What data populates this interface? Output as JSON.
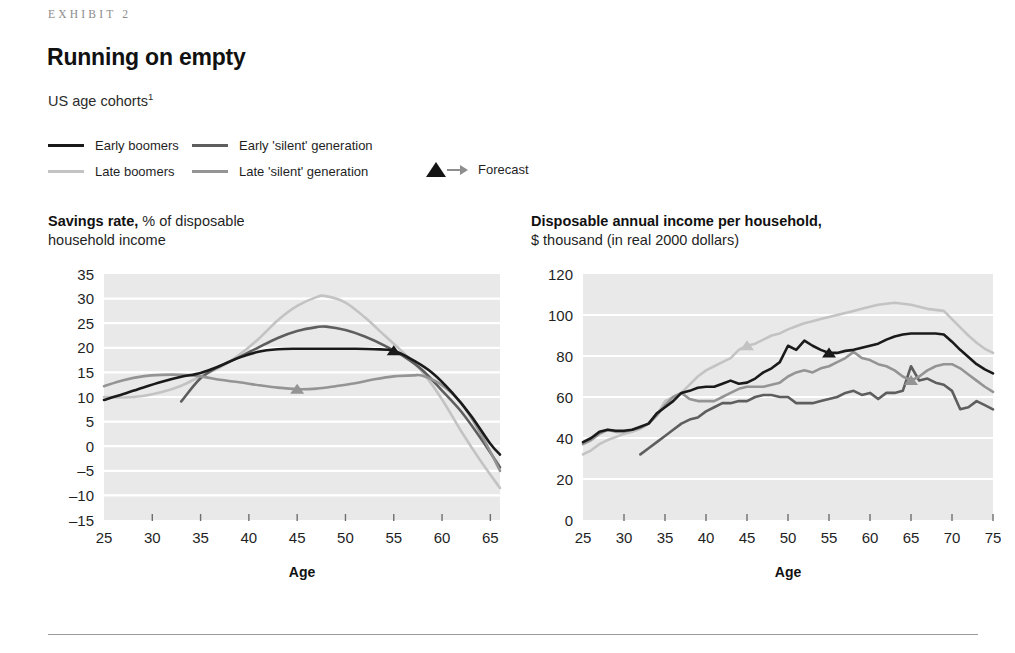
{
  "header": {
    "exhibit_label": "EXHIBIT 2",
    "headline": "Running on empty",
    "subhead": "US age cohorts",
    "subhead_footnote": "1"
  },
  "legend": {
    "items": [
      {
        "label": "Early boomers",
        "color": "#1a1a1a",
        "key": "early_boomers"
      },
      {
        "label": "Late boomers",
        "color": "#c3c3c3",
        "key": "late_boomers"
      },
      {
        "label": "Early 'silent' generation",
        "color": "#5e5e5e",
        "key": "early_silent"
      },
      {
        "label": "Late 'silent' generation",
        "color": "#949494",
        "key": "late_silent"
      }
    ],
    "forecast_label": "Forecast",
    "forecast_marker_color": "#141414",
    "forecast_arrow_color": "#8e8e8e"
  },
  "colors": {
    "plot_background": "#e9e9e9",
    "gridline": "#ffffff",
    "axis_text": "#1f1f1f",
    "tick": "#6e6e6e"
  },
  "chart_data": [
    {
      "id": "savings-rate",
      "type": "line",
      "title_bold": "Savings rate,",
      "title_rest": " % of disposable",
      "title_line2": "household income",
      "xlabel": "Age",
      "ylabel": "",
      "xlim": [
        25,
        66
      ],
      "ylim": [
        -15,
        35
      ],
      "xticks": [
        25,
        30,
        35,
        40,
        45,
        50,
        55,
        60,
        65
      ],
      "yticks": [
        35,
        30,
        25,
        20,
        15,
        10,
        5,
        0,
        -5,
        -10,
        -15
      ],
      "ytick_labels": [
        "35",
        "30",
        "25",
        "20",
        "15",
        "10",
        "5",
        "0",
        "–5",
        "–10",
        "–15"
      ],
      "grid": "horizontal",
      "legend_position": "above-figure",
      "series": [
        {
          "name": "Early boomers",
          "color": "#1a1a1a",
          "forecast_marker": {
            "x": 55,
            "y": 19.4
          },
          "x": [
            25,
            27,
            29,
            31,
            33,
            35,
            37,
            39,
            41,
            43,
            45,
            47,
            49,
            51,
            53,
            55,
            57,
            59,
            61,
            63,
            65,
            66
          ],
          "y": [
            9.4,
            10.6,
            11.9,
            13.1,
            14.1,
            14.9,
            16.3,
            18.0,
            19.2,
            19.7,
            19.8,
            19.8,
            19.8,
            19.8,
            19.7,
            19.4,
            17.5,
            14.9,
            11.0,
            6.2,
            0.5,
            -1.7
          ]
        },
        {
          "name": "Late boomers",
          "color": "#c3c3c3",
          "forecast_marker": null,
          "x": [
            25,
            27,
            29,
            31,
            33,
            35,
            37,
            39,
            41,
            43,
            45,
            47,
            48,
            50,
            52,
            54,
            56,
            58,
            60,
            62,
            64,
            66
          ],
          "y": [
            10.0,
            9.9,
            10.2,
            11.0,
            12.3,
            14.2,
            16.0,
            18.6,
            21.8,
            25.6,
            28.5,
            30.3,
            30.5,
            29.2,
            26.2,
            22.6,
            19.0,
            15.0,
            9.5,
            3.0,
            -3.0,
            -8.5
          ]
        },
        {
          "name": "Early 'silent' generation",
          "color": "#5e5e5e",
          "forecast_marker": null,
          "x": [
            33,
            35,
            37,
            39,
            41,
            43,
            45,
            47,
            48,
            50,
            52,
            54,
            56,
            58,
            60,
            62,
            64,
            66
          ],
          "y": [
            9.1,
            13.8,
            16.3,
            18.1,
            20.1,
            22.0,
            23.4,
            24.2,
            24.3,
            23.6,
            22.3,
            20.5,
            18.3,
            15.4,
            11.3,
            7.0,
            1.6,
            -4.3
          ]
        },
        {
          "name": "Late 'silent' generation",
          "color": "#949494",
          "forecast_marker": {
            "x": 45,
            "y": 11.6
          },
          "x": [
            25,
            27,
            29,
            31,
            33,
            35,
            37,
            39,
            41,
            43,
            45,
            47,
            49,
            51,
            53,
            55,
            57,
            58,
            60,
            62,
            64,
            66
          ],
          "y": [
            12.2,
            13.4,
            14.2,
            14.5,
            14.5,
            14.2,
            13.5,
            13.0,
            12.4,
            11.9,
            11.6,
            11.7,
            12.2,
            12.8,
            13.6,
            14.2,
            14.4,
            14.3,
            12.4,
            8.7,
            2.6,
            -5.0
          ]
        }
      ]
    },
    {
      "id": "disposable-income",
      "type": "line",
      "title_bold": "Disposable annual income per household,",
      "title_rest": "",
      "title_line2": "$ thousand (in real 2000 dollars)",
      "xlabel": "Age",
      "ylabel": "",
      "xlim": [
        25,
        75
      ],
      "ylim": [
        0,
        120
      ],
      "xticks": [
        25,
        30,
        35,
        40,
        45,
        50,
        55,
        60,
        65,
        70,
        75
      ],
      "yticks": [
        120,
        100,
        80,
        60,
        40,
        20,
        0
      ],
      "ytick_labels": [
        "120",
        "100",
        "80",
        "60",
        "40",
        "20",
        "0"
      ],
      "grid": "horizontal",
      "legend_position": "above-figure",
      "series": [
        {
          "name": "Early boomers",
          "color": "#1a1a1a",
          "forecast_marker": {
            "x": 55,
            "y": 81.5
          },
          "x": [
            25,
            26,
            27,
            28,
            29,
            30,
            31,
            32,
            33,
            34,
            35,
            36,
            37,
            38,
            39,
            40,
            41,
            42,
            43,
            44,
            45,
            46,
            47,
            48,
            49,
            50,
            51,
            52,
            53,
            54,
            55,
            56,
            57,
            58,
            59,
            60,
            61,
            62,
            63,
            64,
            65,
            66,
            67,
            68,
            69,
            70,
            71,
            72,
            73,
            74,
            75
          ],
          "y": [
            38,
            40,
            43,
            44,
            43.5,
            43.5,
            44,
            45.5,
            47,
            52,
            55,
            58,
            62,
            63,
            64.5,
            65,
            65,
            66.5,
            68,
            66.5,
            67,
            69,
            72,
            74,
            77,
            85,
            83,
            87.5,
            85,
            83,
            81.5,
            81.5,
            82.5,
            83,
            84,
            85,
            86,
            88,
            89.5,
            90.5,
            91,
            91,
            91,
            91,
            90.5,
            87,
            83,
            79.5,
            76,
            73.5,
            71.5
          ]
        },
        {
          "name": "Late boomers",
          "color": "#c3c3c3",
          "forecast_marker": {
            "x": 45,
            "y": 85
          },
          "x": [
            25,
            26,
            27,
            28,
            29,
            30,
            31,
            32,
            33,
            34,
            35,
            36,
            37,
            38,
            39,
            40,
            41,
            42,
            43,
            44,
            45,
            46,
            47,
            48,
            49,
            50,
            51,
            52,
            53,
            54,
            55,
            56,
            57,
            58,
            59,
            60,
            61,
            62,
            63,
            64,
            65,
            66,
            67,
            68,
            69,
            70,
            71,
            72,
            73,
            74,
            75
          ],
          "y": [
            32,
            34,
            37,
            39,
            40.5,
            42,
            43,
            44.5,
            47,
            51,
            58,
            60,
            62,
            66,
            70,
            73,
            75,
            77,
            79,
            83,
            85,
            86,
            88,
            90,
            91,
            93,
            94.5,
            96,
            97,
            98,
            99,
            100,
            101,
            102,
            103,
            104,
            105,
            105.5,
            106,
            105.5,
            105,
            104,
            103,
            102.5,
            102,
            98,
            94,
            90,
            86.5,
            83.5,
            81.5
          ]
        },
        {
          "name": "Early 'silent' generation",
          "color": "#5e5e5e",
          "forecast_marker": null,
          "x": [
            32,
            33,
            34,
            35,
            36,
            37,
            38,
            39,
            40,
            41,
            42,
            43,
            44,
            45,
            46,
            47,
            48,
            49,
            50,
            51,
            52,
            53,
            54,
            55,
            56,
            57,
            58,
            59,
            60,
            61,
            62,
            63,
            64,
            65,
            66,
            67,
            68,
            69,
            70,
            71,
            72,
            73,
            74,
            75
          ],
          "y": [
            32,
            35,
            38,
            41,
            44,
            47,
            49,
            50,
            53,
            55,
            57,
            57,
            58,
            58,
            60,
            61,
            61,
            60,
            60,
            57,
            57,
            57,
            58,
            59,
            60,
            62,
            63,
            61,
            62,
            59,
            62,
            62,
            63,
            75,
            68,
            69,
            67,
            66,
            63,
            54,
            55,
            58,
            56,
            54
          ]
        },
        {
          "name": "Late 'silent' generation",
          "color": "#949494",
          "forecast_marker": {
            "x": 65,
            "y": 68
          },
          "x": [
            25,
            26,
            27,
            28,
            29,
            30,
            31,
            32,
            33,
            34,
            35,
            36,
            37,
            38,
            39,
            40,
            41,
            42,
            43,
            44,
            45,
            46,
            47,
            48,
            49,
            50,
            51,
            52,
            53,
            54,
            55,
            56,
            57,
            58,
            59,
            60,
            61,
            62,
            63,
            64,
            65,
            66,
            67,
            68,
            69,
            70,
            71,
            72,
            73,
            74,
            75
          ],
          "y": [
            37,
            39,
            42,
            44,
            43,
            43,
            44,
            45,
            47,
            51,
            56,
            60,
            62,
            59,
            58,
            58,
            58,
            60,
            62,
            64,
            65,
            65,
            65,
            66,
            67,
            70,
            72,
            73,
            72,
            74,
            75,
            77,
            79,
            82,
            79,
            78,
            76,
            75,
            73,
            70,
            68,
            70,
            73,
            75,
            76,
            76,
            74,
            71,
            68,
            65,
            62.5
          ]
        }
      ]
    }
  ]
}
